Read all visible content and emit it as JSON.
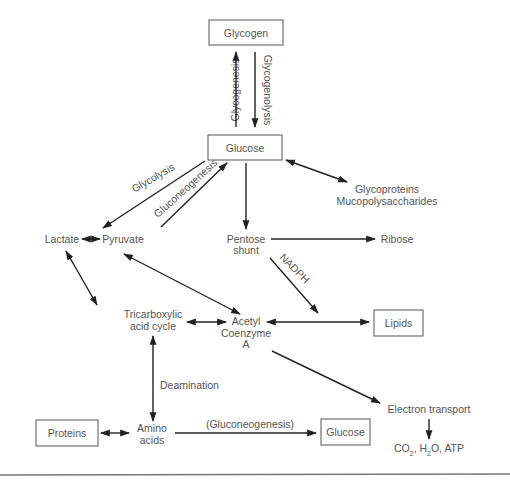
{
  "diagram": {
    "nodes": {
      "glycogen": "Glycogen",
      "glucose_top": "Glucose",
      "glycoproteins_1": "Glycoproteins",
      "glycoproteins_2": "Mucopolysaccharides",
      "lactate": "Lactate",
      "pyruvate": "Pyruvate",
      "pentose_1": "Pentose",
      "pentose_2": "shunt",
      "ribose": "Ribose",
      "tca_1": "Tricarboxylic",
      "tca_2": "acid cycle",
      "acetyl_1": "Acetyl",
      "acetyl_2": "Coenzyme",
      "acetyl_3": "A",
      "lipids": "Lipids",
      "proteins": "Proteins",
      "amino_1": "Amino",
      "amino_2": "acids",
      "glucose_bottom": "Glucose",
      "electron_transport": "Electron transport",
      "products_co": "CO",
      "products_sub2a": "2",
      "products_h": ", H",
      "products_sub2b": "2",
      "products_rest": "O, ATP"
    },
    "edge_labels": {
      "glycogenesis": "Glycogenesis",
      "glycogenolysis": "Glycogenolysis",
      "glycolysis": "Glycolysis",
      "gluconeogenesis": "Gluconeogenesis",
      "nadph": "NADPH",
      "deamination": "Deamination",
      "gluconeogenesis_paren": "(Gluconeogenesis)"
    },
    "colors": {
      "text": "#555555",
      "line": "#222222",
      "box_border": "#555555",
      "background": "#ffffff"
    }
  }
}
